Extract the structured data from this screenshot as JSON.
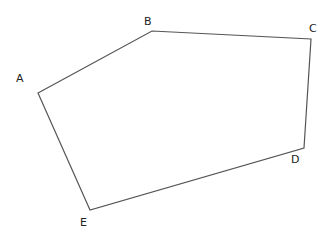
{
  "diagram": {
    "type": "pentagon",
    "stroke_color": "#555555",
    "label_color": "#222222",
    "vertices": [
      {
        "label": "A",
        "x": 38,
        "y": 93,
        "lx": 16,
        "ly": 82
      },
      {
        "label": "B",
        "x": 152,
        "y": 31,
        "lx": 144,
        "ly": 25
      },
      {
        "label": "C",
        "x": 311,
        "y": 39,
        "lx": 309,
        "ly": 32
      },
      {
        "label": "D",
        "x": 304,
        "y": 148,
        "lx": 291,
        "ly": 163
      },
      {
        "label": "E",
        "x": 90,
        "y": 210,
        "lx": 80,
        "ly": 226
      }
    ]
  }
}
